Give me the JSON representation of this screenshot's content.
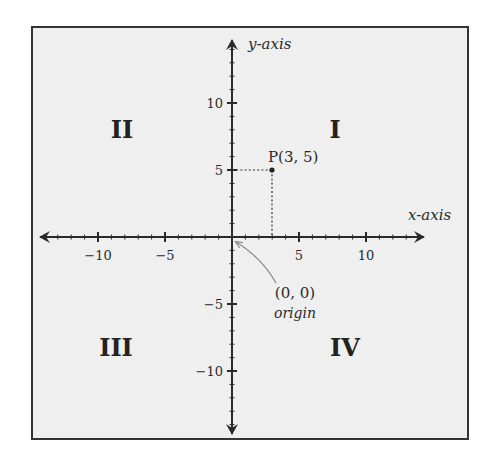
{
  "diagram": {
    "type": "cartesian-coordinate-plane",
    "frame": {
      "background": "#efefef",
      "border": "#333333"
    },
    "axes": {
      "x_label": "x-axis",
      "y_label": "y-axis",
      "range": [
        -14,
        14
      ],
      "major_step": 5,
      "minor_step": 1,
      "x_tick_labels": [
        {
          "value": -10,
          "text": "−10"
        },
        {
          "value": -5,
          "text": "−5"
        },
        {
          "value": 5,
          "text": "5"
        },
        {
          "value": 10,
          "text": "10"
        }
      ],
      "y_tick_labels": [
        {
          "value": 10,
          "text": "10"
        },
        {
          "value": 5,
          "text": "5"
        },
        {
          "value": -5,
          "text": "−5"
        },
        {
          "value": -10,
          "text": "−10"
        }
      ]
    },
    "quadrants": [
      {
        "id": "I",
        "label": "I"
      },
      {
        "id": "II",
        "label": "II"
      },
      {
        "id": "III",
        "label": "III"
      },
      {
        "id": "IV",
        "label": "IV"
      }
    ],
    "point": {
      "label": "P(3, 5)",
      "x": 3,
      "y": 5
    },
    "origin": {
      "coords_label": "(0, 0)",
      "name_label": "origin"
    }
  }
}
